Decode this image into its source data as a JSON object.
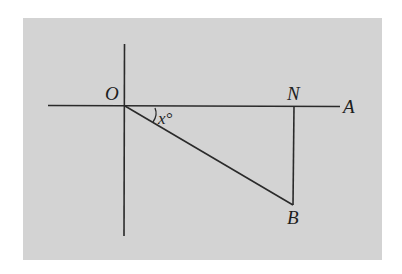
{
  "figure": {
    "background_color": "#d3d3d3",
    "line_color": "#2a2a2a",
    "page_color": "#ffffff"
  },
  "points": {
    "O": {
      "label": "O",
      "x": 124,
      "y": 106
    },
    "N": {
      "label": "N",
      "x": 293,
      "y": 106
    },
    "A": {
      "label": "A",
      "x": 340,
      "y": 106
    },
    "B": {
      "label": "B",
      "x": 293,
      "y": 205
    }
  },
  "angle": {
    "label": "x°",
    "variable": "x",
    "unit": "°",
    "between": [
      "ON",
      "OB"
    ]
  },
  "lines": [
    {
      "name": "horizontal-axis",
      "from": "left-end",
      "to": "A"
    },
    {
      "name": "vertical-axis",
      "from": "top-end",
      "to": "bottom-end"
    },
    {
      "name": "segment-OB",
      "from": "O",
      "to": "B"
    },
    {
      "name": "segment-NB",
      "from": "N",
      "to": "B"
    }
  ]
}
